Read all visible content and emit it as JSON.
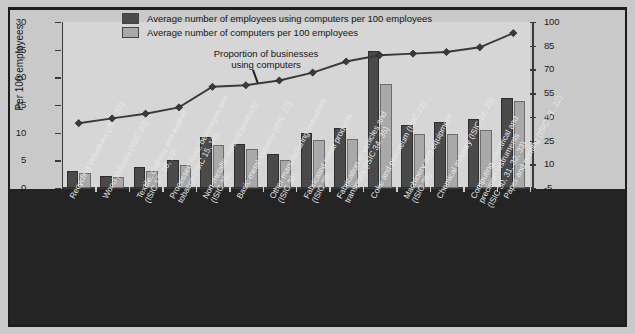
{
  "figure": {
    "background_color": "#c9c9c9",
    "plot_background_color": "#d6d6d6",
    "label_band_color": "#242424"
  },
  "legend": {
    "position": "top-center",
    "items": [
      {
        "label": "Average number of employees using computers per 100 employees",
        "color": "#4a4a4a",
        "swatch": "dark-square-swatch"
      },
      {
        "label": "Average number of computers per 100 employees",
        "color": "#a9a9a9",
        "swatch": "light-square-swatch"
      }
    ]
  },
  "annotation": {
    "line1": "Proportion of businesses",
    "line2": "using computers"
  },
  "axes": {
    "left": {
      "title": "Per 100 employees",
      "ticks": [
        "0",
        "5",
        "10",
        "15",
        "20",
        "25",
        "30"
      ],
      "min": 0,
      "max": 30
    },
    "right": {
      "title": "Proportion using computers (per cent)",
      "ticks": [
        "-5",
        "10",
        "25",
        "40",
        "55",
        "70",
        "85",
        "100"
      ],
      "min": -5,
      "max": 100
    }
  },
  "chart_data": {
    "type": "bar",
    "title": "",
    "xlabel": "",
    "ylabel": "Per 100 employees",
    "ylim": [
      0,
      30
    ],
    "y2label": "Proportion using computers (per cent)",
    "y2lim": [
      -5,
      100
    ],
    "grid": false,
    "legend_position": "top-center",
    "categories": [
      "Recycling industries (ISIC 37)",
      "Wood industry (ISIC 20)",
      "Textile, clothing and leather\n(ISIC 17, 18, 19)",
      "Processed food, beverages and\ntobacco (ISIC 15, 16)",
      "Non-metallic mineral products\n(ISIC 26)",
      "Basic metal industry (ISIC 27)",
      "Other manufacturing industries\n(ISIC 36)",
      "Fabricated metal products\n(ISIC 28)",
      "Fabrication of vehicles and\ntransports (ISIC 34, 35)",
      "Coke and petroleum (ISIC 23)",
      "Machinery and equipment\n(ISIC 29)",
      "Chemical industry (ISIC 24, 25)",
      "Computing, electrical and\nprecision instruments\n(ISIC 30, 31, 32, 33)",
      "Paper and printing (ISIC 21, 22)"
    ],
    "series": [
      {
        "name": "Average number of employees using computers per 100 employees",
        "axis": "left",
        "type": "bar",
        "color": "#4a4a4a",
        "values": [
          3.0,
          2.2,
          3.8,
          5.0,
          9.2,
          8.0,
          6.1,
          10.0,
          10.9,
          24.8,
          11.4,
          11.9,
          12.4,
          16.3
        ]
      },
      {
        "name": "Average number of computers per 100 employees",
        "axis": "left",
        "type": "bar",
        "color": "#a9a9a9",
        "values": [
          2.7,
          2.0,
          3.0,
          4.2,
          7.8,
          7.0,
          5.1,
          8.7,
          8.9,
          18.8,
          9.8,
          9.8,
          10.4,
          15.7
        ]
      },
      {
        "name": "Proportion of businesses using computers",
        "axis": "right",
        "type": "line",
        "color": "#3a3a3a",
        "marker": "diamond",
        "values": [
          36,
          39,
          42,
          46,
          59,
          60,
          63,
          68,
          75,
          79,
          80,
          81,
          84,
          93
        ]
      }
    ]
  }
}
